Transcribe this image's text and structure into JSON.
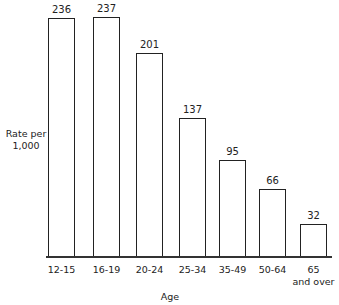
{
  "chart_data": {
    "type": "bar",
    "title": "",
    "xlabel": "Age",
    "ylabel": "Rate per 1,000",
    "categories": [
      "12-15",
      "16-19",
      "20-24",
      "25-34",
      "35-49",
      "50-64",
      "65 and over"
    ],
    "values": [
      236,
      237,
      201,
      137,
      95,
      66,
      32
    ],
    "ylim": [
      0,
      250
    ],
    "grid": false,
    "legend": null
  },
  "labels": {
    "ylabel_line1": "Rate per",
    "ylabel_line2": "1,000",
    "xlabel": "Age",
    "ticks": [
      "12-15",
      "16-19",
      "20-24",
      "25-34",
      "35-49",
      "50-64",
      "65"
    ],
    "tick_last_line2": "and over",
    "values": [
      "236",
      "237",
      "201",
      "137",
      "95",
      "66",
      "32"
    ]
  }
}
